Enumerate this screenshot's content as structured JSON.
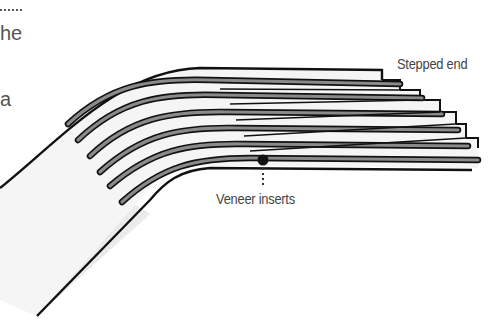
{
  "diagram": {
    "labels": {
      "stepped_end": "Stepped end",
      "veneer_inserts": "Veneer inserts"
    },
    "cut_off_text": [
      "he",
      "a"
    ],
    "layer_count": 6,
    "colors": {
      "outline": "#111111",
      "veneer_fill": "#8a8a8a",
      "laminate_fill": "#f4f4f4",
      "shaded_region": "#e6e6e6",
      "label_text": "#444444"
    }
  }
}
